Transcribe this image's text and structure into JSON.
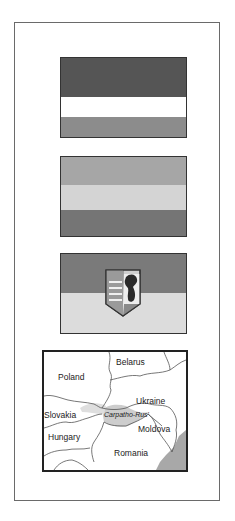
{
  "flags": [
    {
      "name": "flag-1",
      "bands": [
        {
          "color": "#555555"
        },
        {
          "color": "#ffffff"
        },
        {
          "color": "#8c8c8c"
        }
      ]
    },
    {
      "name": "flag-2",
      "bands": [
        {
          "color": "#a6a6a6"
        },
        {
          "color": "#d4d4d4"
        },
        {
          "color": "#757575"
        }
      ]
    },
    {
      "name": "flag-3-with-coat-of-arms",
      "bands": [
        {
          "color": "#7a7a7a"
        },
        {
          "color": "#dcdcdc"
        }
      ],
      "emblem": "coat-of-arms-bear"
    }
  ],
  "map": {
    "labels": {
      "belarus": "Belarus",
      "poland": "Poland",
      "ukraine": "Ukraine",
      "slovakia": "Slovakia",
      "region": "Carpatho-Rus'",
      "moldova": "Moldova",
      "hungary": "Hungary",
      "romania": "Romania"
    },
    "colors": {
      "border_line": "#555555",
      "sea": "#a8a8a8",
      "highlight": "#bdbdbd"
    }
  }
}
